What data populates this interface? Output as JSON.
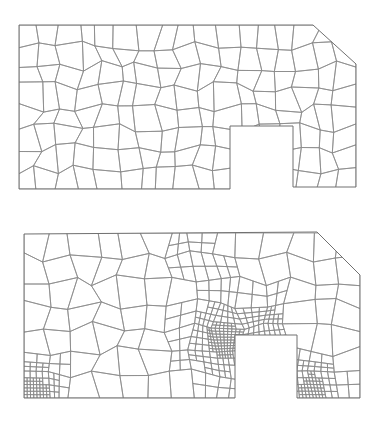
{
  "figure": {
    "panels": [
      {
        "id": "coarse",
        "label": "coarse-quad-mesh",
        "top": 0,
        "height": 211,
        "outline": [
          [
            19,
            25
          ],
          [
            313,
            25
          ],
          [
            356,
            64
          ],
          [
            356,
            187
          ],
          [
            293,
            187
          ],
          [
            293,
            126
          ],
          [
            230,
            126
          ],
          [
            230,
            189
          ],
          [
            19,
            189
          ]
        ],
        "notch": {
          "x1": 230,
          "y1": 126,
          "x2": 293,
          "y2": 189
        },
        "bbox": {
          "x1": 19,
          "y1": 25,
          "x2": 356,
          "y2": 189
        },
        "cells": {
          "cols": 17,
          "rows": 8,
          "jitter": 5.5
        },
        "refinement": []
      },
      {
        "id": "refined",
        "label": "adaptively-refined-quad-mesh",
        "top": 211,
        "height": 211,
        "outline": [
          [
            24,
            23
          ],
          [
            317,
            21
          ],
          [
            360,
            64
          ],
          [
            360,
            187
          ],
          [
            297,
            187
          ],
          [
            297,
            124
          ],
          [
            235,
            124
          ],
          [
            235,
            187
          ],
          [
            24,
            187
          ]
        ],
        "notch": {
          "x1": 235,
          "y1": 124,
          "x2": 297,
          "y2": 187
        },
        "bbox": {
          "x1": 24,
          "y1": 22,
          "x2": 360,
          "y2": 187
        },
        "cells": {
          "cols": 14,
          "rows": 7,
          "jitter": 6
        },
        "refinement": [
          {
            "x": 34,
            "y": 178,
            "r": 42,
            "levels": 3
          },
          {
            "x": 224,
            "y": 128,
            "r": 52,
            "levels": 3
          },
          {
            "x": 313,
            "y": 176,
            "r": 40,
            "levels": 3
          },
          {
            "x": 266,
            "y": 112,
            "r": 34,
            "levels": 2
          },
          {
            "x": 200,
            "y": 50,
            "r": 30,
            "levels": 1
          }
        ]
      }
    ],
    "colors": {
      "background": "#ffffff",
      "mesh_line": "#8a8a8a",
      "outline": "#707070"
    }
  }
}
